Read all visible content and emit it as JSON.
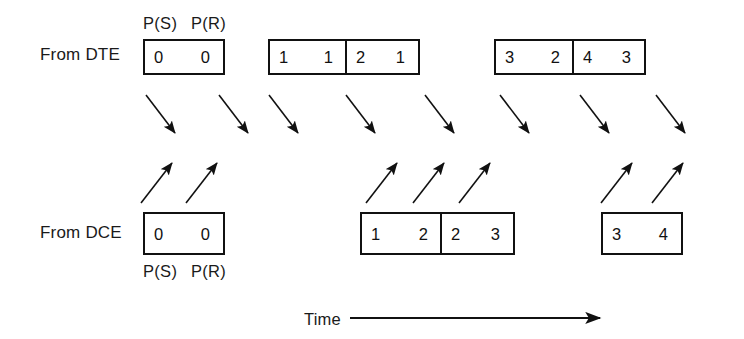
{
  "diagram": {
    "colors": {
      "ink": "#111111",
      "background": "#ffffff"
    },
    "rows": [
      {
        "id": "dte",
        "label": "From DTE",
        "header": {
          "ps": "P(S)",
          "pr": "P(R)"
        },
        "groups": [
          {
            "id": "dte-g1",
            "cells": [
              {
                "ps": "0",
                "pr": "0"
              }
            ]
          },
          {
            "id": "dte-g2",
            "cells": [
              {
                "ps": "1",
                "pr": "1"
              },
              {
                "ps": "2",
                "pr": "1"
              }
            ]
          },
          {
            "id": "dte-g3",
            "cells": [
              {
                "ps": "3",
                "pr": "2"
              },
              {
                "ps": "4",
                "pr": "3"
              }
            ]
          }
        ]
      },
      {
        "id": "dce",
        "label": "From DCE",
        "footer": {
          "ps": "P(S)",
          "pr": "P(R)"
        },
        "groups": [
          {
            "id": "dce-g1",
            "cells": [
              {
                "ps": "0",
                "pr": "0"
              }
            ]
          },
          {
            "id": "dce-g2",
            "cells": [
              {
                "ps": "1",
                "pr": "2"
              },
              {
                "ps": "2",
                "pr": "3"
              }
            ]
          },
          {
            "id": "dce-g3",
            "cells": [
              {
                "ps": "3",
                "pr": "4"
              }
            ]
          }
        ]
      }
    ],
    "axis": {
      "label": "Time",
      "direction": "left-to-right"
    },
    "arrow_counts": {
      "down_dte_to_dce": 8,
      "up_dce_to_dte": 7
    }
  }
}
